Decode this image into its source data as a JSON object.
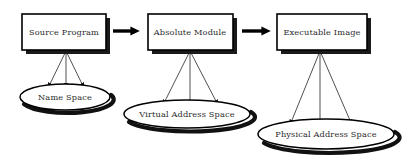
{
  "diagram": {
    "background_color": "#ffffff",
    "line_color": "#000000",
    "text_color": "#2b2b2b",
    "stages": [
      {
        "id": "source-program",
        "box_label": "Source Program",
        "box": {
          "x": 22,
          "y": 14,
          "width": 84,
          "height": 36
        },
        "shadow_offset": 4,
        "space_label": "Name Space",
        "ellipse": {
          "cx": 65,
          "cy": 97,
          "rx": 45,
          "ry": 13
        },
        "fan": {
          "origin_x": 66,
          "origin_y": 51,
          "targets": [
            48,
            66,
            84
          ],
          "target_y": 88
        }
      },
      {
        "id": "absolute-module",
        "box_label": "Absolute Module",
        "box": {
          "x": 148,
          "y": 14,
          "width": 85,
          "height": 36
        },
        "shadow_offset": 4,
        "space_label": "Virtual Address Space",
        "ellipse": {
          "cx": 187,
          "cy": 114,
          "rx": 63,
          "ry": 14
        },
        "fan": {
          "origin_x": 190,
          "origin_y": 51,
          "targets": [
            163,
            190,
            218
          ],
          "target_y": 105
        }
      },
      {
        "id": "executable-image",
        "box_label": "Executable Image",
        "box": {
          "x": 277,
          "y": 14,
          "width": 90,
          "height": 36
        },
        "shadow_offset": 4,
        "space_label": "Physical Address Space",
        "ellipse": {
          "cx": 326,
          "cy": 134,
          "rx": 68,
          "ry": 15
        },
        "fan": {
          "origin_x": 320,
          "origin_y": 51,
          "targets": [
            290,
            320,
            352
          ],
          "target_y": 125
        }
      }
    ],
    "flow_arrows": [
      {
        "id": "arrow-source-to-module",
        "x1": 113,
        "x2": 139,
        "y": 31
      },
      {
        "id": "arrow-module-to-image",
        "x1": 242,
        "x2": 270,
        "y": 31
      }
    ]
  }
}
